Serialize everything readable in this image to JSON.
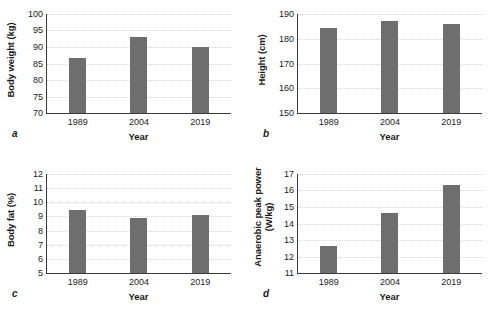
{
  "figure": {
    "bar_color": "#6e6e6e",
    "axis_color": "#3a3a3a",
    "grid_color": "#d6d6d6",
    "background": "#ffffff"
  },
  "panels": [
    {
      "letter": "a",
      "ylabel": "Body weight (kg)",
      "xlabel": "Year",
      "yticks": [
        "100",
        "95",
        "90",
        "85",
        "80",
        "75",
        "70"
      ],
      "xticks": [
        "1989",
        "2004",
        "2019"
      ]
    },
    {
      "letter": "b",
      "ylabel": "Height (cm)",
      "xlabel": "Year",
      "yticks": [
        "190",
        "180",
        "170",
        "160",
        "150"
      ],
      "xticks": [
        "1989",
        "2004",
        "2019"
      ]
    },
    {
      "letter": "c",
      "ylabel": "Body fat (%)",
      "xlabel": "Year",
      "yticks": [
        "12",
        "11",
        "10",
        "9",
        "8",
        "7",
        "6",
        "5"
      ],
      "xticks": [
        "1989",
        "2004",
        "2019"
      ]
    },
    {
      "letter": "d",
      "ylabel": "Anaerobic peak power\n(W/kg)",
      "xlabel": "Year",
      "yticks": [
        "17",
        "16",
        "15",
        "14",
        "13",
        "12",
        "11"
      ],
      "xticks": [
        "1989",
        "2004",
        "2019"
      ]
    }
  ],
  "chart_data": [
    {
      "type": "bar",
      "panel": "a",
      "title": "",
      "categories": [
        "1989",
        "2004",
        "2019"
      ],
      "values": [
        86.7,
        93.1,
        90.0
      ],
      "xlabel": "Year",
      "ylabel": "Body weight (kg)",
      "ylim": [
        70,
        100
      ],
      "ytick_step": 5,
      "grid": true,
      "legend": null
    },
    {
      "type": "bar",
      "panel": "b",
      "title": "",
      "categories": [
        "1989",
        "2004",
        "2019"
      ],
      "values": [
        184.4,
        187.3,
        186.1
      ],
      "xlabel": "Year",
      "ylabel": "Height (cm)",
      "ylim": [
        150,
        190
      ],
      "ytick_step": 10,
      "grid": true,
      "legend": null
    },
    {
      "type": "bar",
      "panel": "c",
      "title": "",
      "categories": [
        "1989",
        "2004",
        "2019"
      ],
      "values": [
        9.45,
        8.9,
        9.1
      ],
      "xlabel": "Year",
      "ylabel": "Body fat (%)",
      "ylim": [
        5,
        12
      ],
      "ytick_step": 1,
      "grid": true,
      "legend": null
    },
    {
      "type": "bar",
      "panel": "d",
      "title": "",
      "categories": [
        "1989",
        "2004",
        "2019"
      ],
      "values": [
        12.65,
        14.65,
        16.35
      ],
      "xlabel": "Year",
      "ylabel": "Anaerobic peak power (W/kg)",
      "ylim": [
        11,
        17
      ],
      "ytick_step": 1,
      "grid": true,
      "legend": null
    }
  ]
}
